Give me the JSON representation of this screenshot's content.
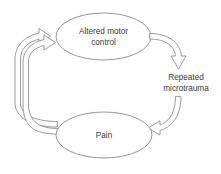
{
  "diagram": {
    "type": "cycle-flow-diagram",
    "background_color": "#ffffff",
    "line_color": "#8a8a8a",
    "text_color": "#3b3b3b",
    "nodes": [
      {
        "id": "altered-motor-control",
        "shape": "ellipse",
        "label_line1": "Altered motor",
        "label_line2": "control"
      },
      {
        "id": "pain",
        "shape": "ellipse",
        "label_line1": "Pain",
        "label_line2": ""
      }
    ],
    "edge_labels": [
      {
        "id": "repeated-microtrauma",
        "label_line1": "Repeated",
        "label_line2": "microtrauma"
      }
    ],
    "connectors": [
      {
        "id": "altered-motor-to-microtrauma",
        "from": "altered-motor-control",
        "to": "repeated-microtrauma",
        "style": "hollow-block-arrow",
        "direction": "down"
      },
      {
        "id": "microtrauma-to-pain",
        "from": "repeated-microtrauma",
        "to": "pain",
        "style": "hollow-block-arrow",
        "direction": "left"
      },
      {
        "id": "pain-to-altered-motor-outer",
        "from": "pain",
        "to": "altered-motor-control",
        "style": "hollow-block-arrow",
        "direction": "up-right"
      },
      {
        "id": "pain-to-altered-motor-inner",
        "from": "pain",
        "to": "altered-motor-control",
        "style": "hollow-block-arrow",
        "direction": "up-right"
      }
    ]
  }
}
